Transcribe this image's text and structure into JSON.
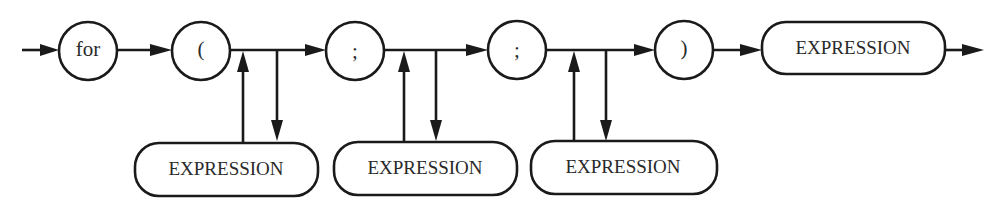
{
  "diagram": {
    "type": "syntax-diagram",
    "colors": {
      "line": "#1a1a1a",
      "text": "#2a2a2a",
      "background": "#ffffff"
    },
    "terminals": [
      {
        "id": "for",
        "label": "for"
      },
      {
        "id": "lparen",
        "label": "("
      },
      {
        "id": "semi1",
        "label": ";"
      },
      {
        "id": "semi2",
        "label": ";"
      },
      {
        "id": "rparen",
        "label": ")"
      }
    ],
    "nonterminals": {
      "body": {
        "label": "EXPRESSION"
      },
      "init": {
        "label": "EXPRESSION"
      },
      "condition": {
        "label": "EXPRESSION"
      },
      "increment": {
        "label": "EXPRESSION"
      }
    }
  }
}
